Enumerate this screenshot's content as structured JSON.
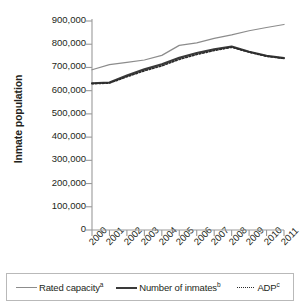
{
  "chart_data": {
    "type": "line",
    "title": "",
    "xlabel": "",
    "ylabel": "Inmate population",
    "x": [
      "2000",
      "2001",
      "2002",
      "2003",
      "2004",
      "2005",
      "2006",
      "2007",
      "2008",
      "2009",
      "2010",
      "2011"
    ],
    "xlim": [
      2000,
      2011
    ],
    "ylim": [
      0,
      900000
    ],
    "yticks": [
      "0",
      "100,000",
      "200,000",
      "300,000",
      "400,000",
      "500,000",
      "600,000",
      "700,000",
      "800,000",
      "900,000"
    ],
    "ytick_values": [
      0,
      100000,
      200000,
      300000,
      400000,
      500000,
      600000,
      700000,
      800000,
      900000
    ],
    "grid": false,
    "legend_position": "bottom",
    "series": [
      {
        "name": "Rated capacity",
        "note_marker": "a",
        "style": "solid-light",
        "color": "#8c8c8c",
        "values": [
          690000,
          712000,
          722000,
          732000,
          752000,
          795000,
          806000,
          825000,
          840000,
          858000,
          872000,
          885000
        ]
      },
      {
        "name": "Number of inmates",
        "note_marker": "b",
        "style": "solid-dark",
        "color": "#3a3a3a",
        "values": [
          632000,
          635000,
          665000,
          692000,
          714000,
          742000,
          762000,
          778000,
          790000,
          768000,
          750000,
          740000
        ]
      },
      {
        "name": "ADP",
        "note_marker": "c",
        "style": "dotted",
        "color": "#2b2b2b",
        "values": [
          630000,
          633000,
          660000,
          686000,
          707000,
          735000,
          756000,
          773000,
          787000,
          766000,
          748000,
          739000
        ]
      }
    ]
  },
  "axes": {
    "y_title": "Inmate population"
  },
  "legend": {
    "items": [
      {
        "label": "Rated capacity",
        "sup": "a"
      },
      {
        "label": "Number of inmates",
        "sup": "b"
      },
      {
        "label": "ADP",
        "sup": "c"
      }
    ]
  }
}
